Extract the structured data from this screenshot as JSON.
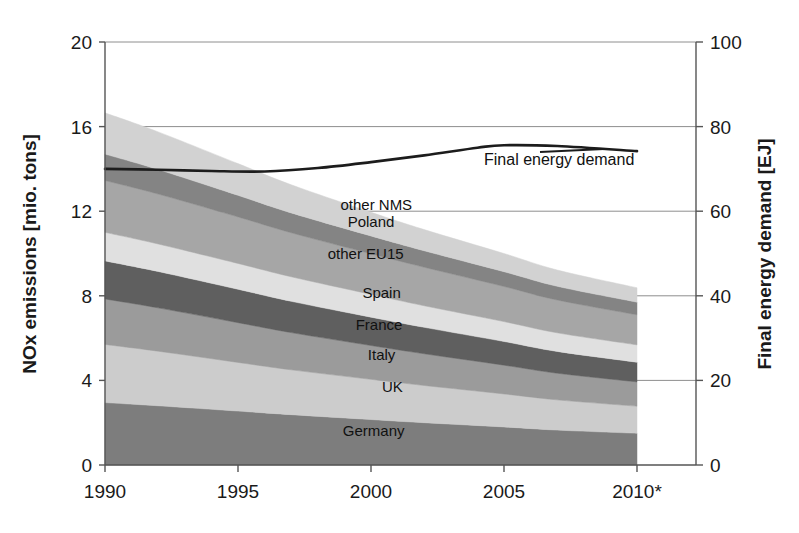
{
  "chart_data": {
    "type": "area",
    "title": "",
    "subtitle": "",
    "xlabel": "",
    "ylabel": "NOx emissions [mio. tons]",
    "y2label": "Final energy demand [EJ]",
    "grid": true,
    "legend_position": "inline-labels",
    "x": [
      1990,
      1992,
      1995,
      1997,
      2000,
      2002,
      2005,
      2007,
      2010
    ],
    "xticks": [
      1990,
      1995,
      2000,
      2005,
      2010
    ],
    "xtick_labels": [
      "1990",
      "1995",
      "2000",
      "2005",
      "2010*"
    ],
    "xlim": [
      1990,
      2010
    ],
    "ylim": [
      0,
      20
    ],
    "yticks": [
      0,
      4,
      8,
      12,
      16,
      20
    ],
    "ytick_labels": [
      "0",
      "4",
      "8",
      "12",
      "16",
      "20"
    ],
    "y2lim": [
      0,
      100
    ],
    "y2ticks": [
      0,
      20,
      40,
      60,
      80,
      100
    ],
    "y2tick_labels": [
      "0",
      "20",
      "40",
      "60",
      "80",
      "100"
    ],
    "stack_order_bottom_to_top": [
      "Germany",
      "UK",
      "Italy",
      "France",
      "Spain",
      "other EU15",
      "Poland",
      "other NMS"
    ],
    "series": [
      {
        "name": "Germany",
        "color": "#7d7d7d",
        "values": [
          2.95,
          2.8,
          2.55,
          2.38,
          2.15,
          2.0,
          1.8,
          1.65,
          1.5
        ]
      },
      {
        "name": "UK",
        "color": "#cccccc",
        "values": [
          2.75,
          2.58,
          2.3,
          2.12,
          1.9,
          1.76,
          1.56,
          1.43,
          1.28
        ]
      },
      {
        "name": "Italy",
        "color": "#9b9b9b",
        "values": [
          2.15,
          2.05,
          1.88,
          1.76,
          1.6,
          1.5,
          1.36,
          1.26,
          1.15
        ]
      },
      {
        "name": "France",
        "color": "#5f5f5f",
        "values": [
          1.8,
          1.72,
          1.58,
          1.48,
          1.34,
          1.25,
          1.12,
          1.03,
          0.93
        ]
      },
      {
        "name": "Spain",
        "color": "#e0e0e0",
        "values": [
          1.35,
          1.3,
          1.22,
          1.16,
          1.08,
          1.02,
          0.94,
          0.88,
          0.82
        ]
      },
      {
        "name": "other EU15",
        "color": "#a6a6a6",
        "values": [
          2.45,
          2.36,
          2.2,
          2.08,
          1.92,
          1.82,
          1.66,
          1.55,
          1.42
        ]
      },
      {
        "name": "Poland",
        "color": "#848484",
        "values": [
          1.25,
          1.16,
          1.02,
          0.94,
          0.84,
          0.78,
          0.7,
          0.65,
          0.6
        ]
      },
      {
        "name": "other NMS",
        "color": "#d2d2d2",
        "values": [
          1.95,
          1.78,
          1.5,
          1.33,
          1.12,
          1.0,
          0.86,
          0.77,
          0.68
        ]
      }
    ],
    "totals": [
      16.65,
      15.75,
      14.25,
      13.25,
      11.95,
      11.13,
      10.0,
      9.22,
      8.38
    ],
    "overlay_line": {
      "name": "Final energy demand",
      "label": "Final energy demand",
      "axis": "right",
      "unit": "EJ",
      "color": "#1c1c1c",
      "x": [
        1990,
        1992,
        1994,
        1996,
        1998,
        2000,
        2002,
        2004,
        2005,
        2007,
        2010
      ],
      "values": [
        70.0,
        69.8,
        69.5,
        69.4,
        70.2,
        71.6,
        73.2,
        75.0,
        75.6,
        75.4,
        74.2
      ]
    },
    "band_labels": [
      {
        "text": "other NMS",
        "x": 2000.2,
        "y": 12.3
      },
      {
        "text": "Poland",
        "x": 2000.0,
        "y": 11.5
      },
      {
        "text": "other EU15",
        "x": 1999.8,
        "y": 10.0
      },
      {
        "text": "Spain",
        "x": 2000.4,
        "y": 8.15
      },
      {
        "text": "France",
        "x": 2000.3,
        "y": 6.6
      },
      {
        "text": "Italy",
        "x": 2000.4,
        "y": 5.2
      },
      {
        "text": "UK",
        "x": 2000.8,
        "y": 3.7
      },
      {
        "text": "Germany",
        "x": 2000.1,
        "y": 1.6
      }
    ],
    "footnote_marker": "*"
  },
  "figure": {
    "background": "#ffffff",
    "plot_left_px": 105,
    "plot_right_px": 696,
    "plot_top_px": 42,
    "plot_bottom_px": 465,
    "data_right_px": 637
  }
}
